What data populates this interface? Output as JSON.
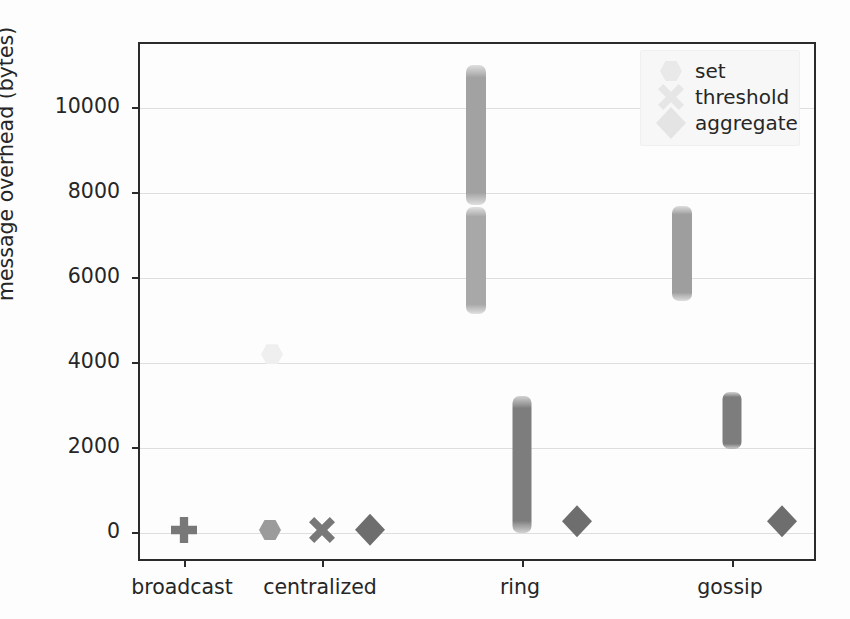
{
  "chart_data": {
    "type": "scatter",
    "title": "",
    "xlabel": "",
    "ylabel": "message overhead (bytes)",
    "categories": [
      "broadcast",
      "centralized",
      "ring",
      "gossip"
    ],
    "ylim": [
      -700,
      11500
    ],
    "yticks": [
      0,
      2000,
      4000,
      6000,
      8000,
      10000
    ],
    "ytick_labels": [
      "0",
      "2000",
      "4000",
      "6000",
      "8000",
      "10000"
    ],
    "grid": true,
    "legend_position": "upper right",
    "legend": [
      "set",
      "threshold",
      "aggregate"
    ],
    "series": [
      {
        "name": "set",
        "marker": "hexagon",
        "color": "#9b9b9b",
        "points": [
          {
            "category": "broadcast",
            "value_range": [
              40,
              110
            ],
            "center": 75,
            "spread": "point"
          },
          {
            "category": "centralized",
            "value_range": [
              4150,
              4260
            ],
            "center": 4205,
            "spread": "point"
          },
          {
            "category": "ring",
            "value_range": [
              5150,
              7680
            ],
            "center": 6400,
            "spread": "strip"
          },
          {
            "category": "ring",
            "value_range": [
              7720,
              11000
            ],
            "center": 9350,
            "spread": "strip"
          },
          {
            "category": "gossip",
            "value_range": [
              5450,
              7700
            ],
            "center": 6600,
            "spread": "strip"
          }
        ]
      },
      {
        "name": "threshold",
        "marker": "x",
        "color": "#787878",
        "points": [
          {
            "category": "broadcast",
            "value_range": [
              40,
              110
            ],
            "center": 75,
            "spread": "point"
          },
          {
            "category": "centralized",
            "value_range": [
              30,
              120
            ],
            "center": 75,
            "spread": "point"
          },
          {
            "category": "ring",
            "value_range": [
              0,
              3230
            ],
            "center": 1600,
            "spread": "strip"
          },
          {
            "category": "gossip",
            "value_range": [
              1980,
              3330
            ],
            "center": 2650,
            "spread": "strip"
          }
        ]
      },
      {
        "name": "aggregate",
        "marker": "diamond",
        "color": "#6e6e6e",
        "points": [
          {
            "category": "broadcast",
            "value_range": [
              40,
              110
            ],
            "center": 75,
            "spread": "point"
          },
          {
            "category": "centralized",
            "value_range": [
              40,
              120
            ],
            "center": 80,
            "spread": "point"
          },
          {
            "category": "ring",
            "value_range": [
              230,
              330
            ],
            "center": 280,
            "spread": "point"
          },
          {
            "category": "gossip",
            "value_range": [
              230,
              330
            ],
            "center": 280,
            "spread": "point"
          }
        ]
      }
    ],
    "marks": [
      {
        "name": "broadcast-set-threshold-aggregate-overlap",
        "series": "threshold",
        "marker": "plus",
        "x_px": 182,
        "y_value": 75,
        "note": "overlapping markers render as plus"
      },
      {
        "name": "centralized-set",
        "series": "set",
        "marker": "hexagon",
        "x_px": 268,
        "y_value": 75
      },
      {
        "name": "centralized-set-high",
        "series": "set",
        "marker": "hexagon",
        "x_px": 270,
        "y_value": 4205,
        "faint": true
      },
      {
        "name": "centralized-threshold",
        "series": "threshold",
        "marker": "x",
        "x_px": 320,
        "y_value": 75
      },
      {
        "name": "centralized-aggregate",
        "series": "aggregate",
        "marker": "diamond",
        "x_px": 368,
        "y_value": 80
      },
      {
        "name": "ring-aggregate",
        "series": "aggregate",
        "marker": "diamond",
        "x_px": 575,
        "y_value": 280
      },
      {
        "name": "gossip-aggregate",
        "series": "aggregate",
        "marker": "diamond",
        "x_px": 780,
        "y_value": 280
      }
    ],
    "strips": [
      {
        "name": "ring-set-upper",
        "series": "set",
        "x_px": 474,
        "value_min": 7720,
        "value_max": 11000,
        "color": "#a2a2a2",
        "width_px": 20
      },
      {
        "name": "ring-set-lower",
        "series": "set",
        "x_px": 474,
        "value_min": 5150,
        "value_max": 7680,
        "color": "#a8a8a8",
        "width_px": 20
      },
      {
        "name": "ring-threshold",
        "series": "threshold",
        "x_px": 520,
        "value_min": 0,
        "value_max": 3230,
        "color": "#7d7d7d",
        "width_px": 19
      },
      {
        "name": "gossip-set",
        "series": "set",
        "x_px": 680,
        "value_min": 5450,
        "value_max": 7700,
        "color": "#9e9e9e",
        "width_px": 20
      },
      {
        "name": "gossip-threshold",
        "series": "threshold",
        "x_px": 730,
        "value_min": 1980,
        "value_max": 3330,
        "color": "#7d7d7d",
        "width_px": 19
      }
    ]
  },
  "axis": {
    "ylabel": "message overhead (bytes)",
    "ytick_labels": [
      "10000",
      "8000",
      "6000",
      "4000",
      "2000",
      "0"
    ],
    "xtick_labels": [
      "broadcast",
      "centralized",
      "ring",
      "gossip"
    ]
  },
  "legend": {
    "items": [
      {
        "label": "set",
        "marker": "hexagon"
      },
      {
        "label": "threshold",
        "marker": "x"
      },
      {
        "label": "aggregate",
        "marker": "diamond"
      }
    ]
  },
  "colors": {
    "axis": "#2b2b2b",
    "grid": "#dedede",
    "text": "#262626",
    "set": "#9b9b9b",
    "threshold": "#787878",
    "aggregate": "#6e6e6e",
    "background": "#ffffff"
  }
}
